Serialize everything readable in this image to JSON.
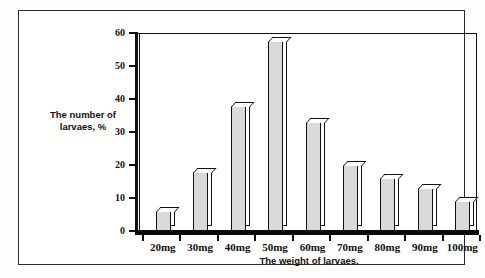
{
  "chart_data": {
    "type": "bar",
    "title": "",
    "categories": [
      "20mg",
      "30mg",
      "40mg",
      "50mg",
      "60mg",
      "70mg",
      "80mg",
      "90mg",
      "100mg"
    ],
    "values": [
      6,
      18,
      38,
      57.5,
      33,
      20,
      16,
      13,
      9
    ],
    "xlabel": "The weight of larvaes.",
    "ylabel": "The number of larvaes, %",
    "ylabel_line1": "The number of",
    "ylabel_line2": "larvaes, %",
    "ylim": [
      0,
      60
    ],
    "ytick_labels": [
      "0",
      "10",
      "20",
      "30",
      "40",
      "50",
      "60"
    ],
    "ytick_values": [
      0,
      10,
      20,
      30,
      40,
      50,
      60
    ],
    "grid": false,
    "legend": false,
    "legend_position": "none",
    "series": [
      {
        "name": "The number of larvaes, %",
        "values": [
          6,
          18,
          38,
          57.5,
          33,
          20,
          16,
          13,
          9
        ]
      }
    ],
    "colors": {
      "bar_fill": "#d9d9d9",
      "bar_outline": "#111111",
      "axis": "#111111",
      "background": "#ffffff",
      "frame": "#2a2a2a"
    }
  }
}
